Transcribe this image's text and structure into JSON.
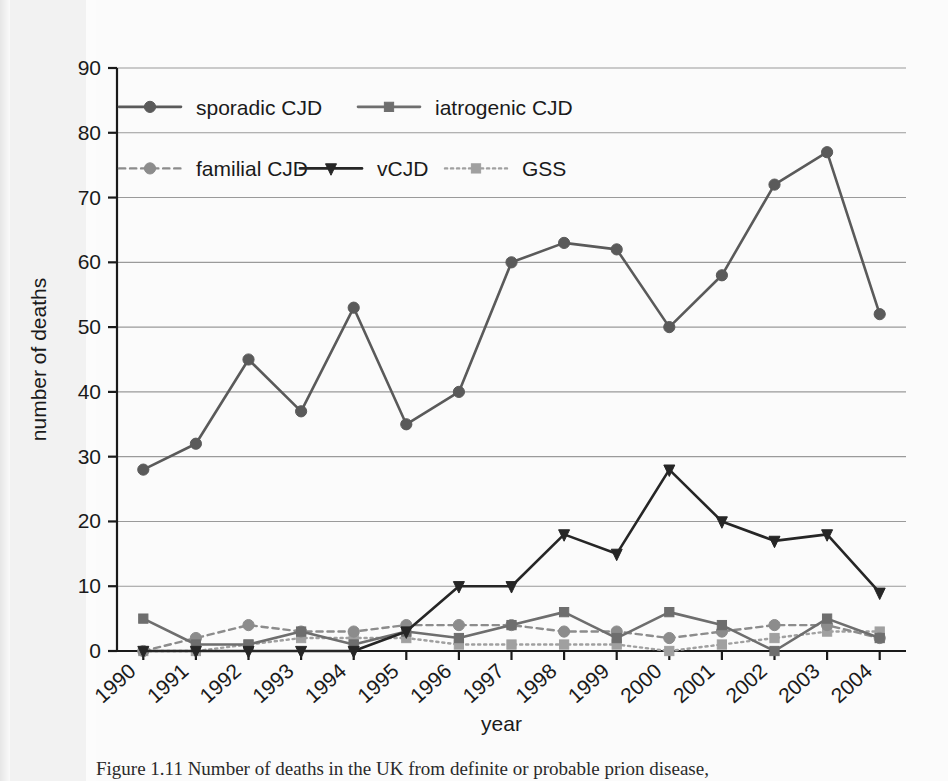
{
  "figure": {
    "caption": "Figure 1.11   Number of deaths in the UK from definite or probable prion disease,"
  },
  "chart_data": {
    "type": "line",
    "title": "",
    "xlabel": "year",
    "ylabel": "number of deaths",
    "categories": [
      "1990",
      "1991",
      "1992",
      "1993",
      "1994",
      "1995",
      "1996",
      "1997",
      "1998",
      "1999",
      "2000",
      "2001",
      "2002",
      "2003",
      "2004"
    ],
    "x_tick_labels": [
      "1990",
      "1991",
      "1992",
      "1993",
      "1994",
      "1995",
      "1996",
      "1997",
      "1998",
      "1999",
      "2000",
      "2001",
      "2002",
      "2003",
      "2004"
    ],
    "y_tick_labels": [
      "0",
      "10",
      "20",
      "30",
      "40",
      "50",
      "60",
      "70",
      "80",
      "90"
    ],
    "y_ticks": [
      0,
      10,
      20,
      30,
      40,
      50,
      60,
      70,
      80,
      90
    ],
    "ylim": [
      0,
      90
    ],
    "grid": "horizontal",
    "legend_position": "top-inside",
    "series": [
      {
        "name": "sporadic CJD",
        "marker": "circle",
        "line_style": "solid",
        "color": "#5a5a5a",
        "values": [
          28,
          32,
          45,
          37,
          53,
          35,
          40,
          60,
          63,
          62,
          50,
          58,
          72,
          77,
          52
        ]
      },
      {
        "name": "iatrogenic CJD",
        "marker": "square",
        "line_style": "solid",
        "color": "#6e6e6e",
        "values": [
          5,
          1,
          1,
          3,
          1,
          3,
          2,
          4,
          6,
          2,
          6,
          4,
          0,
          5,
          2
        ]
      },
      {
        "name": "familial CJD",
        "marker": "circle",
        "line_style": "dashed",
        "color": "#8c8c8c",
        "values": [
          0,
          2,
          4,
          3,
          3,
          4,
          4,
          4,
          3,
          3,
          2,
          3,
          4,
          4,
          2
        ]
      },
      {
        "name": "vCJD",
        "marker": "triangle-down",
        "line_style": "solid",
        "color": "#262626",
        "values": [
          0,
          0,
          0,
          0,
          0,
          3,
          10,
          10,
          18,
          15,
          28,
          20,
          17,
          18,
          9
        ]
      },
      {
        "name": "GSS",
        "marker": "square",
        "line_style": "dotted",
        "color": "#a0a0a0",
        "values": [
          0,
          0,
          1,
          2,
          2,
          2,
          1,
          1,
          1,
          1,
          0,
          1,
          2,
          3,
          3
        ]
      }
    ]
  }
}
